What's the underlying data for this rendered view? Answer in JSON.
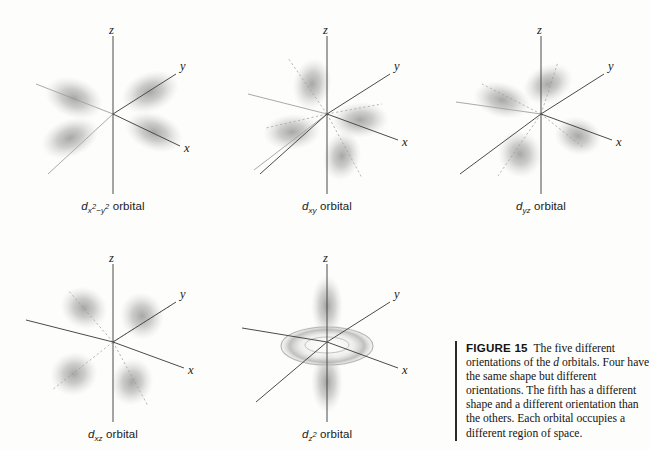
{
  "figure": {
    "number_label": "FIGURE 15",
    "caption_text": "The five different orientations of the d orbitals. Four have the same shape but different orientations. The fifth has a different shape and a different orientation than the others. Each orbital occupies a different region of space.",
    "caption_parts": {
      "lead": "The five different orientations of the ",
      "italic_term": "d",
      "rest": " orbitals. Four have the same shape but different orientations. The fifth has a different shape and a different orientation than the others. Each orbital occupies a different region of space."
    }
  },
  "axes": {
    "z": "z",
    "y": "y",
    "x": "x"
  },
  "orbitals": [
    {
      "id": "dx2-y2",
      "base": "d",
      "subscript": "x2−y2",
      "sub_html": "x²−y²",
      "suffix": " orbital",
      "label_plain": "dx2−y2 orbital",
      "lobe_count": 4,
      "lobe_placement": "along x and y axes",
      "shape": "four-lobe cloverleaf"
    },
    {
      "id": "dxy",
      "base": "d",
      "subscript": "xy",
      "sub_html": "xy",
      "suffix": " orbital",
      "label_plain": "dxy orbital",
      "lobe_count": 4,
      "lobe_placement": "between x and y axes",
      "shape": "four-lobe cloverleaf"
    },
    {
      "id": "dyz",
      "base": "d",
      "subscript": "yz",
      "sub_html": "yz",
      "suffix": " orbital",
      "label_plain": "dyz orbital",
      "lobe_count": 4,
      "lobe_placement": "between y and z axes",
      "shape": "four-lobe cloverleaf"
    },
    {
      "id": "dxz",
      "base": "d",
      "subscript": "xz",
      "sub_html": "xz",
      "suffix": " orbital",
      "label_plain": "dxz orbital",
      "lobe_count": 4,
      "lobe_placement": "between x and z axes",
      "shape": "four-lobe cloverleaf"
    },
    {
      "id": "dz2",
      "base": "d",
      "subscript": "z2",
      "sub_html": "z²",
      "suffix": " orbital",
      "label_plain": "dz2 orbital",
      "lobe_count": 2,
      "lobe_placement": "along z axis with toroidal ring in xy plane",
      "shape": "two lobes plus doughnut"
    }
  ],
  "colors": {
    "background": "#fdfdfb",
    "axis_line": "#4b4b4b",
    "guide_line": "#9a9a9a",
    "lobe_gray": "#9d9d9d",
    "text": "#1a1a1a",
    "caption_rule": "#2a2a2a"
  }
}
